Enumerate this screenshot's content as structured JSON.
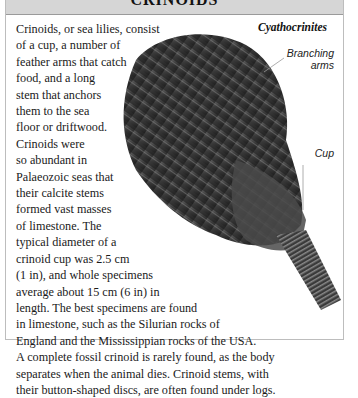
{
  "header": {
    "title": "CRINOIDS"
  },
  "caption": "Cyathocrinites",
  "labels": {
    "arms_line1": "Branching",
    "arms_line2": "arms",
    "cup": "Cup"
  },
  "body_lines": [
    "Crinoids, or sea lilies, consist",
    "of a cup, a number of",
    "feather arms that catch",
    "food, and a long",
    "stem that anchors",
    "them to the sea",
    "floor or driftwood.",
    "Crinoids were",
    "so abundant in",
    "Palaeozoic seas that",
    "their calcite stems",
    "formed vast masses",
    "of limestone. The",
    "typical diameter of a",
    "crinoid cup was 2.5 cm",
    "(1 in), and whole specimens",
    "average about 15 cm (6 in) in",
    "length. The best specimens are found",
    "in limestone, such as the Silurian rocks of",
    "England and the Mississippian rocks of the USA.",
    "A complete fossil crinoid is rarely found, as the body",
    "separates when the animal dies. Crinoid stems, with",
    "their button-shaped discs, are often found under logs."
  ],
  "colors": {
    "header_bg": "#d6d6d6",
    "fossil_dark": "#2a2a2a",
    "fossil_mid": "#5a5a5a"
  }
}
